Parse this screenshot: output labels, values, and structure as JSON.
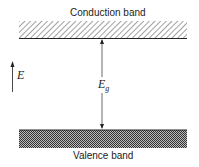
{
  "diagram": {
    "conduction_band_label": "Conduction band",
    "valence_band_label": "Valence band",
    "energy_axis_label": "E",
    "gap_label_main": "E",
    "gap_label_sub": "g",
    "colors": {
      "ink": "#222222",
      "background": "#ffffff"
    }
  }
}
